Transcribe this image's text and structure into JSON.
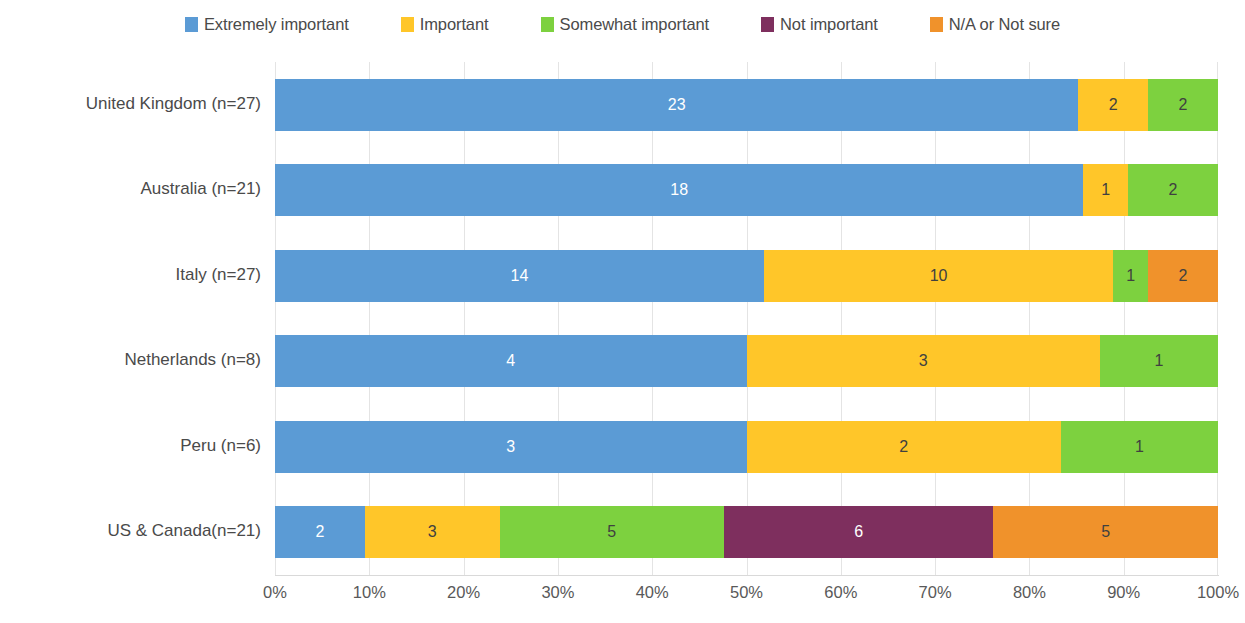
{
  "legend": {
    "items": [
      {
        "label": "Extremely important",
        "color": "#5B9BD5",
        "icon": "legend-swatch-icon"
      },
      {
        "label": "Important",
        "color": "#FFC629",
        "icon": "legend-swatch-icon"
      },
      {
        "label": "Somewhat important",
        "color": "#7DD13F",
        "icon": "legend-swatch-icon"
      },
      {
        "label": "Not important",
        "color": "#7E2F5E",
        "icon": "legend-swatch-icon"
      },
      {
        "label": "N/A or Not sure",
        "color": "#F0922B",
        "icon": "legend-swatch-icon"
      }
    ]
  },
  "chart_data": {
    "type": "bar",
    "orientation": "horizontal",
    "stacked": true,
    "normalized": "percent",
    "title": "",
    "xlabel": "",
    "ylabel": "",
    "xlim": [
      0,
      100
    ],
    "grid": true,
    "legend_position": "top",
    "xticks": [
      "0%",
      "10%",
      "20%",
      "30%",
      "40%",
      "50%",
      "60%",
      "70%",
      "80%",
      "90%",
      "100%"
    ],
    "xtick_values": [
      0,
      10,
      20,
      30,
      40,
      50,
      60,
      70,
      80,
      90,
      100
    ],
    "categories": [
      "United Kingdom (n=27)",
      "Australia (n=21)",
      "Italy (n=27)",
      "Netherlands (n=8)",
      "Peru (n=6)",
      "US & Canada(n=21)"
    ],
    "category_totals": [
      27,
      21,
      27,
      8,
      6,
      21
    ],
    "series": [
      {
        "name": "Extremely important",
        "color": "#5B9BD5",
        "values": [
          23,
          18,
          14,
          4,
          3,
          2
        ]
      },
      {
        "name": "Important",
        "color": "#FFC629",
        "values": [
          2,
          1,
          10,
          3,
          2,
          3
        ]
      },
      {
        "name": "Somewhat important",
        "color": "#7DD13F",
        "values": [
          2,
          2,
          1,
          1,
          1,
          5
        ]
      },
      {
        "name": "Not important",
        "color": "#7E2F5E",
        "values": [
          0,
          0,
          0,
          0,
          0,
          6
        ]
      },
      {
        "name": "N/A or Not sure",
        "color": "#F0922B",
        "values": [
          0,
          0,
          2,
          0,
          0,
          5
        ]
      }
    ],
    "label_colors": [
      "#ffffff",
      "#404040",
      "#404040",
      "#ffffff",
      "#404040"
    ]
  }
}
